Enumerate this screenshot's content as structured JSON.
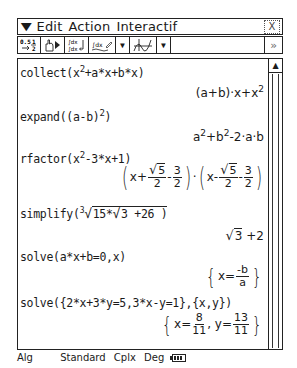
{
  "menubar": {
    "menu_icon": "menu-down-arrow-icon",
    "items": [
      "Edit",
      "Action",
      "Interactif"
    ],
    "close_label": "X"
  },
  "toolbar": {
    "buttons": [
      {
        "name": "fraction-decimal-toggle",
        "label": "0.5 ↔ 1/2",
        "icon": "fraction-decimal-icon"
      },
      {
        "name": "hand-execute",
        "label": "",
        "icon": "hand-pointer-icon"
      },
      {
        "name": "integral-substitute",
        "label": "∫dx",
        "icon": "integral-icon"
      },
      {
        "name": "calculus-menu",
        "label": "∫dx",
        "icon": "calculus-icon"
      },
      {
        "name": "graph-menu",
        "label": "",
        "icon": "graph-icon"
      }
    ],
    "next_label": "»"
  },
  "entries": [
    {
      "input": "collect(x^2+a*x+b*x)",
      "output": "(a+b)·x+x^2"
    },
    {
      "input": "expand((a-b)^2)",
      "output": "a^2+b^2-2·a·b"
    },
    {
      "input": "rfactor(x^2-3*x+1)",
      "output": "(x+√5/2-3/2)·(x-√5/2-3/2)"
    },
    {
      "input": "simplify(∛(15*√3 +26))",
      "output": "√3 +2"
    },
    {
      "input": "solve(a*x+b=0,x)",
      "output": "{x=-b/a}"
    },
    {
      "input": "solve({2*x+3*y=5,3*x-y=1},{x,y})",
      "output": "{x=8/11, y=13/11}"
    }
  ],
  "display": {
    "collect_in": "collect(x",
    "collect_in2": "+a*x+b*x)",
    "collect_out": "(a+b)·x+x",
    "expand_in": "expand((a-b)",
    "expand_in2": ")",
    "expand_out_a": "a",
    "expand_out_b": "+b",
    "expand_out_c": "-2·a·b",
    "rfactor_in": "rfactor(x",
    "rfactor_in2": "-3*x+1)",
    "simplify_in": "simplify(",
    "simplify_rad_index": "3",
    "simplify_rad": "15*",
    "simplify_inner": "3",
    "simplify_tail": " +26  )",
    "simplify_out_rad": "3",
    "simplify_out_tail": " +2",
    "solve1_in": "solve(a*x+b=0,x)",
    "solve2_in": "solve({2*x+3*y=5,3*x-y=1},{x,y})",
    "exp2": "2",
    "sqrt5": "5",
    "two": "2",
    "three": "3",
    "x_plus": "x+",
    "x_minus": "x-",
    "minus": "-",
    "dot": "·",
    "x_eq": "x=",
    "neg_b": "-b",
    "a": "a",
    "y_eq": ", y=",
    "eight": "8",
    "eleven": "11",
    "thirteen": "13"
  },
  "scrollbar": {
    "up_icon": "▲"
  },
  "status": {
    "mode": "Alg",
    "format": "Standard",
    "complex": "Cplx",
    "angle": "Deg",
    "battery": "battery-icon"
  }
}
